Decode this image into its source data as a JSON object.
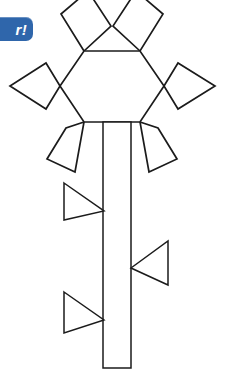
{
  "page": {
    "background_color": "#ffffff",
    "width": 228,
    "height": 378
  },
  "watermark": {
    "name": "watermark-badge",
    "text": "r!",
    "note": "partially cropped blue rounded badge at left edge",
    "background_color": "#2f66ab",
    "text_color": "#ffffff"
  },
  "drawing": {
    "type": "line-art-outline",
    "stroke_color": "#1b1b1b",
    "fill_color": "#ffffff",
    "stroke_width": 1.7,
    "description": "A flower made of a central hexagon with six rhombus petals, a long rectangular stem, and three triangular leaves.",
    "parts": {
      "blossom": {
        "label": "blossom",
        "center": {
          "x": 112,
          "y": 86
        },
        "hexagon": {
          "label": "hexagon-center",
          "points": "84,51 140,51 164,86 140,122 84,122 60,86"
        },
        "petals": [
          {
            "label": "petal-top-left",
            "position": "top-left",
            "points": "84,51 61,14 88,-9 111,26"
          },
          {
            "label": "petal-top-right",
            "position": "top-right",
            "points": "140,51 113,26 136,-9 163,14"
          },
          {
            "label": "petal-left",
            "position": "left",
            "points": "60,86 46,63 10,86 46,109"
          },
          {
            "label": "petal-right",
            "position": "right",
            "points": "164,86 178,63 215,86 178,109"
          },
          {
            "label": "petal-bottom-left",
            "position": "bottom-left",
            "points": "84,122 66,128 47,159 75,172"
          },
          {
            "label": "petal-bottom-right",
            "position": "bottom-right",
            "points": "140,122 158,128 177,159 149,172"
          }
        ]
      },
      "stem": {
        "label": "stem",
        "points": "103,122 131,122 131,368 103,368",
        "top_y": 122,
        "bottom_y": 368,
        "left_x": 103,
        "right_x": 131
      },
      "leaves": [
        {
          "label": "leaf-upper-left",
          "direction": "points-right",
          "points": "64,183 104,211 64,220"
        },
        {
          "label": "leaf-middle-right",
          "direction": "points-left",
          "points": "168,241 168,285 131,268"
        },
        {
          "label": "leaf-lower-left",
          "direction": "points-right",
          "points": "64,292 104,320 64,333"
        }
      ]
    }
  }
}
